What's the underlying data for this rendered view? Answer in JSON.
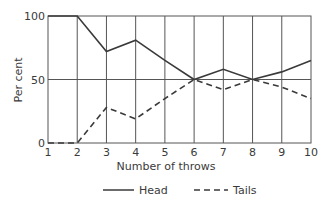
{
  "chart_data": {
    "type": "line",
    "title": "",
    "xlabel": "Number of throws",
    "ylabel": "Per cent",
    "x": [
      1,
      2,
      3,
      4,
      5,
      6,
      7,
      8,
      9,
      10
    ],
    "series": [
      {
        "name": "Head",
        "style": "solid",
        "values": [
          100,
          100,
          72,
          81,
          65,
          50,
          58,
          50,
          56,
          65
        ]
      },
      {
        "name": "Tails",
        "style": "dashed",
        "values": [
          0,
          0,
          28,
          19,
          35,
          50,
          42,
          50,
          44,
          35
        ]
      }
    ],
    "xlim": [
      1,
      10
    ],
    "ylim": [
      0,
      100
    ],
    "xticks": [
      "1",
      "2",
      "3",
      "4",
      "5",
      "6",
      "7",
      "8",
      "9",
      "10"
    ],
    "yticks": [
      "0",
      "50",
      "100"
    ],
    "grid": {
      "vertical": true,
      "horizontal_at": [
        50
      ]
    },
    "legend": {
      "position": "bottom",
      "entries": [
        "Head",
        "Tails"
      ]
    }
  },
  "colors": {
    "line": "#3a3a3a",
    "grid": "#555555",
    "background": "#ffffff"
  }
}
